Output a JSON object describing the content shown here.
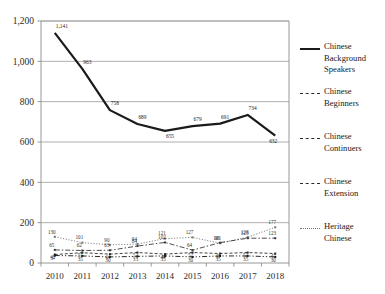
{
  "chart_data": {
    "type": "line",
    "title": "",
    "xlabel": "",
    "ylabel": "",
    "grid": true,
    "legend_position": "right",
    "categories": [
      "2010",
      "2011",
      "2012",
      "2013",
      "2014",
      "2015",
      "2016",
      "2017",
      "2018"
    ],
    "ylim": [
      0,
      1200
    ],
    "yticks": [
      0,
      200,
      400,
      600,
      800,
      1000,
      1200
    ],
    "ytick_labels": [
      "0",
      "200",
      "400",
      "600",
      "800",
      "1,000",
      "1,200"
    ],
    "series": [
      {
        "name": "Chinese Background Speakers",
        "style": "solid",
        "color": "#1a1a1a",
        "width": 2.2,
        "values": [
          1141,
          963,
          758,
          689,
          655,
          679,
          691,
          734,
          632
        ],
        "labels": [
          "1,141",
          "963",
          "758",
          "689",
          "655",
          "679",
          "691",
          "734",
          "632"
        ]
      },
      {
        "name": "Chinese Beginners",
        "style": "dashed",
        "color": "#2b2b2b",
        "width": 0.9,
        "values": [
          42,
          51,
          44,
          52,
          44,
          52,
          47,
          52,
          47
        ],
        "labels": [
          "42",
          "51",
          "44",
          "52",
          "44",
          "52",
          "47",
          "52",
          "47"
        ]
      },
      {
        "name": "Chinese Continuers",
        "style": "dashdot",
        "color": "#3a3a3a",
        "width": 0.9,
        "values": [
          65,
          62,
          63,
          84,
          102,
          64,
          101,
          123,
          123
        ],
        "labels": [
          "65",
          "62",
          "63",
          "84",
          "102",
          "64",
          "101",
          "123",
          "123"
        ]
      },
      {
        "name": "Chinese Extension",
        "style": "dashdotdot",
        "color": "#111111",
        "width": 0.9,
        "values": [
          37,
          35,
          30,
          33,
          35,
          30,
          35,
          35,
          30
        ],
        "labels": [
          "37",
          "35",
          "30",
          "33",
          "35",
          "30",
          "35",
          "35",
          "30"
        ]
      },
      {
        "name": "Heritage Chinese",
        "style": "dotted",
        "color": "#777777",
        "width": 0.9,
        "values": [
          130,
          101,
          90,
          94,
          121,
          127,
          98,
          128,
          177
        ],
        "labels": [
          "130",
          "101",
          "90",
          "94",
          "121",
          "127",
          "98",
          "128",
          "177"
        ]
      }
    ]
  },
  "legend": {
    "items": [
      {
        "label_line1": "Chinese",
        "label_line2": "Background",
        "label_line3": "Speakers",
        "style": "solid"
      },
      {
        "label_line1": "Chinese",
        "label_line2": "Beginners",
        "label_line3": "",
        "style": "dashed"
      },
      {
        "label_line1": "Chinese",
        "label_line2": "Continuers",
        "label_line3": "",
        "style": "dashdot"
      },
      {
        "label_line1": "Chinese",
        "label_line2": "Extension",
        "label_line3": "",
        "style": "dashdotdot"
      },
      {
        "label_line1": "Heritage",
        "label_line2": "Chinese",
        "label_line3": "",
        "style": "dotted"
      }
    ]
  },
  "colors": {
    "axis": "#8c8c8c",
    "grid": "#9a9a9a",
    "text": "#1a1a1a",
    "plot_background": "#ffffff"
  }
}
